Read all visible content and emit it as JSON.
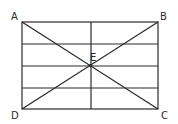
{
  "diagram": {
    "type": "geometry",
    "points": {
      "A": {
        "label": "A"
      },
      "B": {
        "label": "B"
      },
      "C": {
        "label": "C"
      },
      "D": {
        "label": "D"
      },
      "E": {
        "label": "E"
      }
    },
    "colors": {
      "line": "#2a2a2a",
      "background": "#ffffff"
    }
  }
}
